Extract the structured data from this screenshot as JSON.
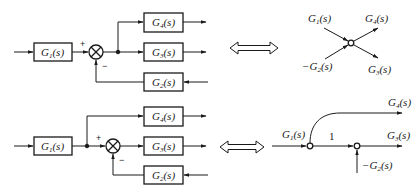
{
  "diagram": {
    "equivalence_symbol": "double-arrow",
    "top": {
      "block_diagram": {
        "blocks": [
          {
            "id": "G1",
            "label": "G",
            "sub": "1",
            "arg": "(s)"
          },
          {
            "id": "G4",
            "label": "G",
            "sub": "4",
            "arg": "(s)"
          },
          {
            "id": "G3",
            "label": "G",
            "sub": "3",
            "arg": "(s)"
          },
          {
            "id": "G2",
            "label": "G",
            "sub": "2",
            "arg": "(s)"
          }
        ],
        "sum_signs": {
          "plus": "+",
          "minus": "−"
        }
      },
      "signal_flow": {
        "labels": [
          {
            "id": "in1",
            "label": "G",
            "sub": "1",
            "arg": "(s)",
            "prefix": ""
          },
          {
            "id": "out4",
            "label": "G",
            "sub": "4",
            "arg": "(s)",
            "prefix": ""
          },
          {
            "id": "in2",
            "label": "G",
            "sub": "2",
            "arg": "(s)",
            "prefix": "−"
          },
          {
            "id": "out3",
            "label": "G",
            "sub": "3",
            "arg": "(s)",
            "prefix": ""
          }
        ]
      }
    },
    "bottom": {
      "block_diagram": {
        "blocks": [
          {
            "id": "G1",
            "label": "G",
            "sub": "1",
            "arg": "(s)"
          },
          {
            "id": "G4",
            "label": "G",
            "sub": "4",
            "arg": "(s)"
          },
          {
            "id": "G3",
            "label": "G",
            "sub": "3",
            "arg": "(s)"
          },
          {
            "id": "G2",
            "label": "G",
            "sub": "2",
            "arg": "(s)"
          }
        ],
        "sum_signs": {
          "plus": "+",
          "minus": "−"
        }
      },
      "signal_flow": {
        "labels": [
          {
            "id": "g1",
            "label": "G",
            "sub": "1",
            "arg": "(s)",
            "prefix": ""
          },
          {
            "id": "unity",
            "text": "1"
          },
          {
            "id": "g4",
            "label": "G",
            "sub": "4",
            "arg": "(s)",
            "prefix": ""
          },
          {
            "id": "g3",
            "label": "G",
            "sub": "3",
            "arg": "(s)",
            "prefix": ""
          },
          {
            "id": "g2",
            "label": "G",
            "sub": "2",
            "arg": "(s)",
            "prefix": "−"
          }
        ]
      }
    },
    "colors": {
      "stroke": "#1a1a1a",
      "background": "#ffffff"
    }
  }
}
